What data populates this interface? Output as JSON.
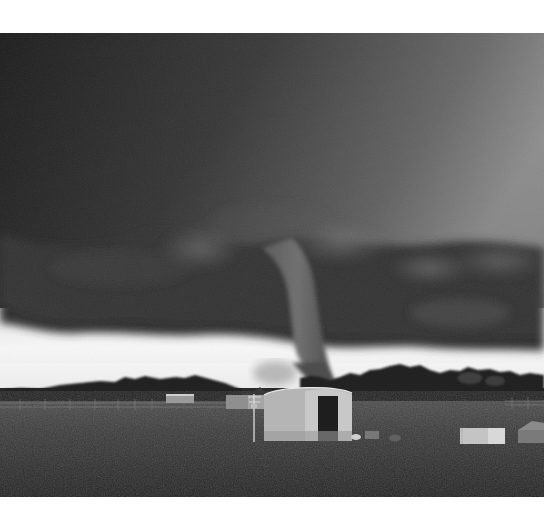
{
  "image": {
    "subject": "Tornado touching down over farmland under a dark supercell",
    "style": "grayscale photograph",
    "alt": "Black and white photo of a tornado funnel descending from a dark wall cloud behind a quonset hut barn, power pole, trees and an open grassy field"
  },
  "scene": {
    "sky": {
      "top_left": "#222222",
      "top_right": "#8a8a8a",
      "wall_cloud": "#3a3a3a",
      "horizon_glow": "#f4f4f4"
    },
    "ground": {
      "grass": "#3a3a3a",
      "grass_dark": "#262626"
    },
    "elements": [
      {
        "name": "wall-cloud",
        "label": "Wall cloud"
      },
      {
        "name": "tornado-funnel",
        "label": "Tornado funnel"
      },
      {
        "name": "tree-line",
        "label": "Tree line"
      },
      {
        "name": "power-pole",
        "label": "Power pole"
      },
      {
        "name": "quonset-barn",
        "label": "Quonset hut barn"
      },
      {
        "name": "small-shed-left",
        "label": "Small shed"
      },
      {
        "name": "white-trailer-right",
        "label": "White trailer"
      },
      {
        "name": "building-right-edge",
        "label": "Building"
      },
      {
        "name": "wire-fence",
        "label": "Wire fence"
      },
      {
        "name": "grass-field",
        "label": "Grass field"
      }
    ]
  }
}
